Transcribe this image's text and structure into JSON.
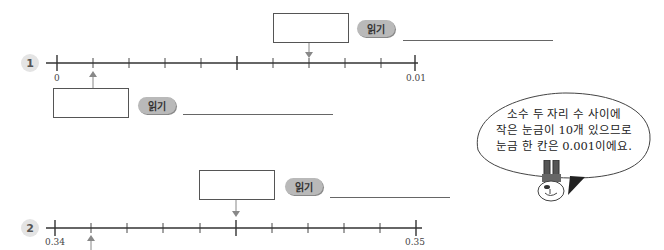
{
  "problems": [
    {
      "number": "1",
      "number_line": {
        "start": "0",
        "end": "0.01",
        "divisions": 10,
        "major_tick_at": 5
      },
      "answers": [
        {
          "position": "above",
          "arrow_at_tick": 7,
          "read_label": "읽기",
          "box_value": "",
          "line_value": ""
        },
        {
          "position": "below",
          "arrow_at_tick": 1,
          "read_label": "읽기",
          "box_value": "",
          "line_value": ""
        }
      ]
    },
    {
      "number": "2",
      "number_line": {
        "start": "0.34",
        "end": "0.35",
        "divisions": 10,
        "major_tick_at": 5
      },
      "answers": [
        {
          "position": "above",
          "arrow_at_tick": 5,
          "read_label": "읽기",
          "box_value": "",
          "line_value": ""
        },
        {
          "position": "below",
          "arrow_at_tick": 1,
          "read_label": "읽기",
          "box_value": "",
          "line_value": ""
        }
      ]
    }
  ],
  "hint_bubble": {
    "line1": "소수 두 자리 수 사이에",
    "line2_pre": "작은 눈금이 ",
    "line2_num": "10",
    "line2_post": "개 있으므로",
    "line3_pre": "눈금 한 칸은 ",
    "line3_num": "0.001",
    "line3_post": "이에요."
  },
  "mascot": {
    "icon": "rabbit-mascot-icon"
  }
}
